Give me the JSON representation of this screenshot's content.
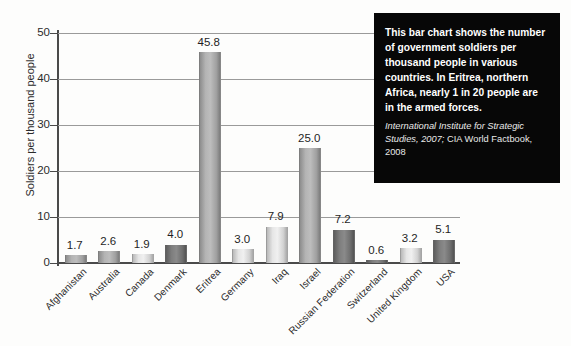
{
  "chart_data": {
    "type": "bar",
    "title": "",
    "xlabel": "",
    "ylabel": "Soldiers per thousand people",
    "ylim": [
      0,
      50
    ],
    "yticks": [
      "0",
      "10",
      "20",
      "30",
      "40",
      "50"
    ],
    "grid": true,
    "legend": "none",
    "categories": [
      "Afghanistan",
      "Australia",
      "Canada",
      "Denmark",
      "Eritrea",
      "Germany",
      "Iraq",
      "Israel",
      "Russian Federation",
      "Switzerland",
      "United Kingdom",
      "USA"
    ],
    "values": [
      1.7,
      2.6,
      1.9,
      4.0,
      45.8,
      3.0,
      7.9,
      25.0,
      7.2,
      0.6,
      3.2,
      5.1
    ],
    "value_labels": [
      "1.7",
      "2.6",
      "1.9",
      "4.0",
      "45.8",
      "3.0",
      "7.9",
      "25.0",
      "7.2",
      "0.6",
      "3.2",
      "5.1"
    ],
    "bar_shades": [
      "mid",
      "mid",
      "light",
      "dark",
      "mid",
      "light",
      "light",
      "mid",
      "dark",
      "dark",
      "light",
      "dark"
    ],
    "annotation": {
      "body": "This bar chart shows the number of government soldiers per thousand people in various countries. In Eritrea, northern Africa, nearly 1 in 20 people are in the armed forces.",
      "source_italic": "International Institute for Strategic Studies, 2007;",
      "source_plain": " CIA World Factbook, 2008"
    }
  },
  "colors": {
    "background": "#fdfdfc",
    "axis": "#4a4a4a",
    "gridline": "#9a9a9a",
    "note_background": "#070707",
    "note_text": "#ffffff",
    "bar_light": "#f0f0f0",
    "bar_mid": "#bdbdbd",
    "bar_dark": "#8a8a8a"
  }
}
